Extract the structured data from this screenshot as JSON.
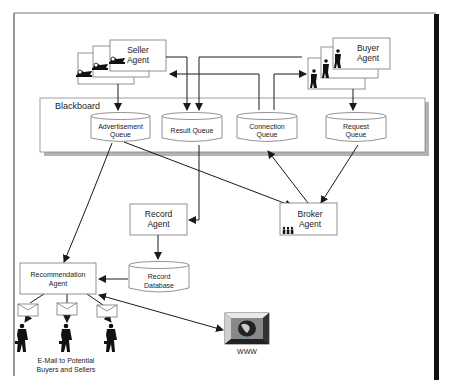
{
  "diagram": {
    "title": "",
    "blackboard": {
      "label": "Blackboard"
    },
    "agents": {
      "seller": {
        "line1": "Seller",
        "line2": "Agent"
      },
      "buyer": {
        "line1": "Buyer",
        "line2": "Agent"
      },
      "record": {
        "line1": "Record",
        "line2": "Agent"
      },
      "broker": {
        "line1": "Broker",
        "line2": "Agent"
      },
      "recommendation": {
        "line1": "Recommendation",
        "line2": "Agent"
      }
    },
    "queues": {
      "advertisement": {
        "line1": "Advertisement",
        "line2": "Queue"
      },
      "result": {
        "line1": "Result Queue"
      },
      "connection": {
        "line1": "Connection",
        "line2": "Queue"
      },
      "request": {
        "line1": "Request",
        "line2": "Queue"
      }
    },
    "database": {
      "line1": "Record",
      "line2": "Database"
    },
    "www": {
      "label": "WWW"
    },
    "email_caption": {
      "line1": "E-Mail to Potential",
      "line2": "Buyers and Sellers"
    },
    "icons": {
      "seller": "ship-icon",
      "buyer": "businessman-icon",
      "broker": "people-group-icon",
      "email": "envelope-icon",
      "recipient": "businessman-with-briefcase-icon",
      "www": "globe-monitor-icon"
    },
    "edges": [
      {
        "from": "Seller Agent",
        "to": "Advertisement Queue"
      },
      {
        "from": "Seller Agent",
        "to": "Result Queue"
      },
      {
        "from": "Result Queue",
        "to": "Seller Agent"
      },
      {
        "from": "Buyer Agent",
        "to": "Result Queue"
      },
      {
        "from": "Connection Queue",
        "to": "Seller Agent"
      },
      {
        "from": "Connection Queue",
        "to": "Buyer Agent"
      },
      {
        "from": "Buyer Agent",
        "to": "Request Queue"
      },
      {
        "from": "Advertisement Queue",
        "to": "Broker Agent"
      },
      {
        "from": "Broker Agent",
        "to": "Connection Queue"
      },
      {
        "from": "Request Queue",
        "to": "Broker Agent"
      },
      {
        "from": "Advertisement Queue",
        "to": "Recommendation Agent"
      },
      {
        "from": "Result Queue",
        "to": "Record Agent"
      },
      {
        "from": "Record Agent",
        "to": "Record Database"
      },
      {
        "from": "Record Database",
        "to": "Recommendation Agent"
      },
      {
        "from": "Recommendation Agent",
        "to": "WWW",
        "bidirectional": true
      },
      {
        "from": "Recommendation Agent",
        "to": "E-Mail"
      }
    ],
    "colors": {
      "line": "#1a1a1a",
      "box_border": "#666666",
      "shadow": "#aaaaaa",
      "frame_bar": "#111111"
    }
  }
}
